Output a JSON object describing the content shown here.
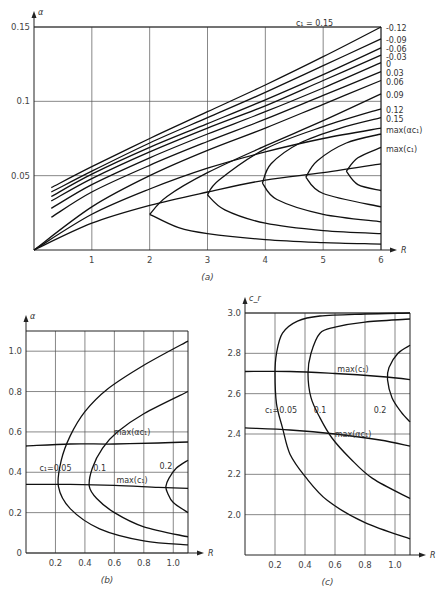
{
  "chart_data": [
    {
      "id": "a",
      "type": "line",
      "caption": "(a)",
      "xlabel": "R",
      "ylabel": "α",
      "xlim": [
        0,
        6
      ],
      "ylim": [
        0,
        0.15
      ],
      "xticks": [
        "1",
        "2",
        "3",
        "4",
        "5",
        "6"
      ],
      "yticks": [
        "0.05",
        "0.1",
        "0.15"
      ],
      "grid": true,
      "pixel_frame": {
        "x0": 34,
        "x1": 381,
        "y0": 250,
        "y1": 27
      },
      "labels": [
        {
          "text": "c₁ = 0.15",
          "x": 4.85,
          "y": 0.153
        },
        {
          "text": "-0.12",
          "x": 6.05,
          "y": 0.149
        },
        {
          "text": "-0.09",
          "x": 6.05,
          "y": 0.141
        },
        {
          "text": "-0.06",
          "x": 6.05,
          "y": 0.135
        },
        {
          "text": "-0.03",
          "x": 6.05,
          "y": 0.13
        },
        {
          "text": "0",
          "x": 6.05,
          "y": 0.125
        },
        {
          "text": "0.03",
          "x": 6.05,
          "y": 0.119
        },
        {
          "text": "0.06",
          "x": 6.05,
          "y": 0.113
        },
        {
          "text": "0.09",
          "x": 6.05,
          "y": 0.104
        },
        {
          "text": "0.12",
          "x": 6.05,
          "y": 0.094
        },
        {
          "text": "0.15",
          "x": 6.05,
          "y": 0.088
        },
        {
          "text": "max(αc₁)",
          "x": 6.05,
          "y": 0.081
        },
        {
          "text": "max(c₁)",
          "x": 6.05,
          "y": 0.068
        }
      ],
      "series": [
        {
          "name": "c1=-0.12",
          "points": [
            [
              0.3,
              0.042
            ],
            [
              1,
              0.056
            ],
            [
              2,
              0.075
            ],
            [
              3,
              0.093
            ],
            [
              4,
              0.111
            ],
            [
              5,
              0.13
            ],
            [
              6,
              0.15
            ]
          ]
        },
        {
          "name": "c1=-0.09",
          "points": [
            [
              0.3,
              0.039
            ],
            [
              1,
              0.053
            ],
            [
              2,
              0.072
            ],
            [
              3,
              0.089
            ],
            [
              4,
              0.106
            ],
            [
              5,
              0.124
            ],
            [
              6,
              0.142
            ]
          ]
        },
        {
          "name": "c1=-0.06",
          "points": [
            [
              0.3,
              0.036
            ],
            [
              1,
              0.051
            ],
            [
              2,
              0.069
            ],
            [
              3,
              0.085
            ],
            [
              4,
              0.101
            ],
            [
              5,
              0.118
            ],
            [
              6,
              0.136
            ]
          ]
        },
        {
          "name": "c1=-0.03",
          "points": [
            [
              0.3,
              0.033
            ],
            [
              1,
              0.048
            ],
            [
              2,
              0.066
            ],
            [
              3,
              0.082
            ],
            [
              4,
              0.097
            ],
            [
              5,
              0.114
            ],
            [
              6,
              0.131
            ]
          ]
        },
        {
          "name": "c1=0",
          "points": [
            [
              0.3,
              0.028
            ],
            [
              1,
              0.044
            ],
            [
              2,
              0.062
            ],
            [
              3,
              0.078
            ],
            [
              4,
              0.093
            ],
            [
              5,
              0.109
            ],
            [
              6,
              0.126
            ]
          ]
        },
        {
          "name": "c1=0.03",
          "points": [
            [
              0.3,
              0.022
            ],
            [
              1,
              0.039
            ],
            [
              2,
              0.057
            ],
            [
              3,
              0.073
            ],
            [
              4,
              0.088
            ],
            [
              5,
              0.104
            ],
            [
              6,
              0.12
            ]
          ]
        },
        {
          "name": "c1=0.06",
          "points": [
            [
              0,
              0
            ],
            [
              1,
              0.029
            ],
            [
              2,
              0.05
            ],
            [
              3,
              0.067
            ],
            [
              4,
              0.082
            ],
            [
              5,
              0.098
            ],
            [
              6,
              0.114
            ]
          ]
        },
        {
          "name": "c1=0.09",
          "points": [
            [
              2.0,
              0.024
            ],
            [
              2.3,
              0.036
            ],
            [
              3,
              0.052
            ],
            [
              4,
              0.07
            ],
            [
              5,
              0.087
            ],
            [
              6,
              0.105
            ]
          ]
        },
        {
          "name": "c1=0.09-lower",
          "points": [
            [
              2.0,
              0.024
            ],
            [
              2.5,
              0.015
            ],
            [
              3,
              0.011
            ],
            [
              4,
              0.007
            ],
            [
              5,
              0.005
            ],
            [
              6,
              0.004
            ]
          ]
        },
        {
          "name": "c1=0.12",
          "points": [
            [
              3.0,
              0.037
            ],
            [
              3.2,
              0.047
            ],
            [
              4,
              0.068
            ],
            [
              5,
              0.083
            ],
            [
              6,
              0.095
            ]
          ]
        },
        {
          "name": "c1=0.12-lower",
          "points": [
            [
              3.0,
              0.037
            ],
            [
              3.3,
              0.027
            ],
            [
              4,
              0.018
            ],
            [
              5,
              0.013
            ],
            [
              6,
              0.011
            ]
          ]
        },
        {
          "name": "c1=0.15a",
          "points": [
            [
              3.95,
              0.045
            ],
            [
              4.1,
              0.058
            ],
            [
              4.6,
              0.072
            ],
            [
              5.3,
              0.082
            ],
            [
              6,
              0.089
            ]
          ]
        },
        {
          "name": "c1=0.15a-lower",
          "points": [
            [
              3.95,
              0.045
            ],
            [
              4.2,
              0.034
            ],
            [
              5,
              0.024
            ],
            [
              6,
              0.019
            ]
          ]
        },
        {
          "name": "c1=0.15b",
          "points": [
            [
              4.7,
              0.049
            ],
            [
              4.9,
              0.06
            ],
            [
              5.4,
              0.072
            ],
            [
              6,
              0.078
            ]
          ]
        },
        {
          "name": "c1=0.15b-lower",
          "points": [
            [
              4.7,
              0.049
            ],
            [
              5.0,
              0.038
            ],
            [
              6,
              0.029
            ]
          ]
        },
        {
          "name": "c1=0.15c",
          "points": [
            [
              5.4,
              0.053
            ],
            [
              5.6,
              0.062
            ],
            [
              6,
              0.069
            ]
          ]
        },
        {
          "name": "c1=0.15c-lower",
          "points": [
            [
              5.4,
              0.053
            ],
            [
              5.6,
              0.044
            ],
            [
              6,
              0.04
            ]
          ]
        },
        {
          "name": "max(alpha c1)",
          "points": [
            [
              0,
              0
            ],
            [
              1,
              0.024
            ],
            [
              2,
              0.041
            ],
            [
              3,
              0.055
            ],
            [
              4,
              0.066
            ],
            [
              5,
              0.075
            ],
            [
              6,
              0.082
            ]
          ]
        },
        {
          "name": "max(c1)",
          "points": [
            [
              0,
              0
            ],
            [
              1,
              0.018
            ],
            [
              2,
              0.03
            ],
            [
              3,
              0.039
            ],
            [
              4,
              0.047
            ],
            [
              5,
              0.052
            ],
            [
              6,
              0.058
            ]
          ]
        }
      ]
    },
    {
      "id": "b",
      "type": "line",
      "caption": "(b)",
      "xlabel": "R",
      "ylabel": "α",
      "xlim": [
        0,
        1.1
      ],
      "ylim": [
        0,
        1.1
      ],
      "xticks": [
        "0.2",
        "0.4",
        "0.6",
        "0.8",
        "1.0"
      ],
      "yticks": [
        "0",
        "0.2",
        "0.4",
        "0.6",
        "0.8",
        "1.0"
      ],
      "grid": true,
      "pixel_frame": {
        "x0": 26,
        "x1": 188,
        "y0": 553,
        "y1": 331
      },
      "labels": [
        {
          "text": "max(αc₁)",
          "x": 0.72,
          "y": 0.6
        },
        {
          "text": "c₁=0.05",
          "x": 0.2,
          "y": 0.42
        },
        {
          "text": "0.1",
          "x": 0.5,
          "y": 0.42
        },
        {
          "text": "0.2",
          "x": 0.95,
          "y": 0.43
        },
        {
          "text": "max(c₁)",
          "x": 0.72,
          "y": 0.36
        }
      ],
      "series": [
        {
          "name": "c1=0.05",
          "points": [
            [
              1.1,
              0.04
            ],
            [
              0.8,
              0.06
            ],
            [
              0.5,
              0.12
            ],
            [
              0.3,
              0.22
            ],
            [
              0.22,
              0.33
            ],
            [
              0.24,
              0.46
            ],
            [
              0.3,
              0.58
            ],
            [
              0.4,
              0.7
            ],
            [
              0.55,
              0.81
            ],
            [
              0.8,
              0.93
            ],
            [
              1.1,
              1.05
            ]
          ]
        },
        {
          "name": "c1=0.1",
          "points": [
            [
              1.1,
              0.08
            ],
            [
              0.8,
              0.13
            ],
            [
              0.6,
              0.2
            ],
            [
              0.48,
              0.27
            ],
            [
              0.43,
              0.33
            ],
            [
              0.45,
              0.42
            ],
            [
              0.52,
              0.52
            ],
            [
              0.62,
              0.6
            ],
            [
              0.8,
              0.69
            ],
            [
              1.1,
              0.8
            ]
          ]
        },
        {
          "name": "c1=0.2",
          "points": [
            [
              1.1,
              0.2
            ],
            [
              1.0,
              0.25
            ],
            [
              0.96,
              0.3
            ],
            [
              0.95,
              0.33
            ],
            [
              0.97,
              0.37
            ],
            [
              1.02,
              0.42
            ],
            [
              1.1,
              0.46
            ]
          ]
        },
        {
          "name": "max(alpha c1)",
          "points": [
            [
              0,
              0.53
            ],
            [
              0.3,
              0.54
            ],
            [
              0.6,
              0.54
            ],
            [
              0.9,
              0.545
            ],
            [
              1.1,
              0.55
            ]
          ]
        },
        {
          "name": "max(c1)",
          "points": [
            [
              0,
              0.34
            ],
            [
              0.3,
              0.34
            ],
            [
              0.6,
              0.335
            ],
            [
              0.9,
              0.325
            ],
            [
              1.1,
              0.32
            ]
          ]
        }
      ]
    },
    {
      "id": "c",
      "type": "line",
      "caption": "(c)",
      "xlabel": "R",
      "ylabel": "c_r",
      "xlim": [
        0,
        1.1
      ],
      "ylim": [
        1.8,
        3.0
      ],
      "xticks": [
        "0.2",
        "0.4",
        "0.6",
        "0.8",
        "1.0"
      ],
      "yticks": [
        "2.0",
        "2.2",
        "2.4",
        "2.6",
        "2.8",
        "3.0"
      ],
      "grid": true,
      "pixel_frame": {
        "x0": 245,
        "x1": 410,
        "y0": 555,
        "y1": 313
      },
      "labels": [
        {
          "text": "max(c₁)",
          "x": 0.72,
          "y": 2.72
        },
        {
          "text": "c₁=0.05",
          "x": 0.24,
          "y": 2.52
        },
        {
          "text": "0.1",
          "x": 0.5,
          "y": 2.52
        },
        {
          "text": "0.2",
          "x": 0.9,
          "y": 2.52
        },
        {
          "text": "max(αc₁)",
          "x": 0.72,
          "y": 2.4
        }
      ],
      "series": [
        {
          "name": "c1=0.05",
          "points": [
            [
              1.1,
              3.0
            ],
            [
              0.8,
              2.995
            ],
            [
              0.5,
              2.985
            ],
            [
              0.35,
              2.96
            ],
            [
              0.25,
              2.9
            ],
            [
              0.21,
              2.8
            ],
            [
              0.2,
              2.7
            ],
            [
              0.21,
              2.55
            ],
            [
              0.25,
              2.43
            ],
            [
              0.3,
              2.3
            ],
            [
              0.4,
              2.19
            ],
            [
              0.55,
              2.07
            ],
            [
              0.8,
              1.96
            ],
            [
              1.1,
              1.88
            ]
          ]
        },
        {
          "name": "c1=0.1",
          "points": [
            [
              1.1,
              2.97
            ],
            [
              0.8,
              2.955
            ],
            [
              0.6,
              2.93
            ],
            [
              0.5,
              2.9
            ],
            [
              0.44,
              2.8
            ],
            [
              0.42,
              2.7
            ],
            [
              0.44,
              2.58
            ],
            [
              0.5,
              2.48
            ],
            [
              0.58,
              2.38
            ],
            [
              0.7,
              2.28
            ],
            [
              0.85,
              2.18
            ],
            [
              1.1,
              2.08
            ]
          ]
        },
        {
          "name": "c1=0.2",
          "points": [
            [
              1.1,
              2.84
            ],
            [
              1.02,
              2.8
            ],
            [
              0.96,
              2.73
            ],
            [
              0.95,
              2.67
            ],
            [
              0.98,
              2.58
            ],
            [
              1.04,
              2.51
            ],
            [
              1.1,
              2.46
            ]
          ]
        },
        {
          "name": "max(c1)",
          "points": [
            [
              0,
              2.71
            ],
            [
              0.3,
              2.71
            ],
            [
              0.6,
              2.7
            ],
            [
              0.9,
              2.685
            ],
            [
              1.1,
              2.67
            ]
          ]
        },
        {
          "name": "max(alpha c1)",
          "points": [
            [
              0,
              2.43
            ],
            [
              0.3,
              2.42
            ],
            [
              0.6,
              2.4
            ],
            [
              0.9,
              2.37
            ],
            [
              1.1,
              2.34
            ]
          ]
        }
      ]
    }
  ]
}
